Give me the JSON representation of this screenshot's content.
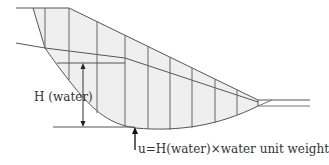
{
  "figure": {
    "type": "slope-stability slice diagram",
    "labels": {
      "h_water": "H (water)",
      "pore_pressure": "u=H(water)×water unit weight"
    },
    "colors": {
      "line": "#555555",
      "fill": "#efefef",
      "text": "#333333",
      "background": "#ffffff"
    },
    "slices": {
      "count": 9,
      "x_positions": [
        45,
        69,
        97,
        125,
        148,
        170,
        192,
        215,
        237
      ]
    }
  }
}
